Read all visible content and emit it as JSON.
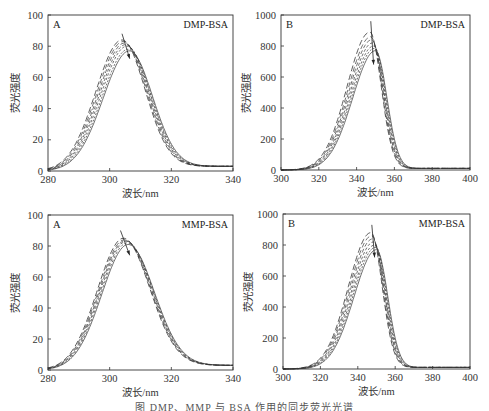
{
  "figure": {
    "caption": "图 DMP、MMP 与 BSA 作用的同步荧光光谱"
  },
  "chart_data": [
    {
      "id": "top-left",
      "type": "line",
      "panel_label": "A",
      "title": "DMP-BSA",
      "xlabel": "波长/nm",
      "ylabel": "荧光强度",
      "xlim": [
        280,
        340
      ],
      "ylim": [
        0,
        100
      ],
      "xticks": [
        280,
        300,
        320,
        340
      ],
      "yticks": [
        0,
        20,
        40,
        60,
        80,
        100
      ],
      "grid": false,
      "legend": "none",
      "annotation": "arrow indicating decreasing intensity with increasing concentration",
      "series": [
        {
          "name": "curve-1",
          "peak_x": 304.0,
          "peak_y": 84
        },
        {
          "name": "curve-2",
          "peak_x": 304.4,
          "peak_y": 83
        },
        {
          "name": "curve-3",
          "peak_x": 304.8,
          "peak_y": 82
        },
        {
          "name": "curve-4",
          "peak_x": 305.2,
          "peak_y": 81
        },
        {
          "name": "curve-5",
          "peak_x": 305.6,
          "peak_y": 80
        },
        {
          "name": "curve-6",
          "peak_x": 306.0,
          "peak_y": 78
        },
        {
          "name": "curve-7",
          "peak_x": 306.4,
          "peak_y": 77
        }
      ],
      "shape": {
        "sigma_left": 8.5,
        "sigma_right": 7.5,
        "baseline": 3
      },
      "arrow": {
        "x1": 304,
        "y1": 88,
        "x2": 306.5,
        "y2": 72
      }
    },
    {
      "id": "top-right",
      "type": "line",
      "panel_label": "B",
      "title": "DMP-BSA",
      "xlabel": "波长/nm",
      "ylabel": "荧光强度",
      "xlim": [
        300,
        400
      ],
      "ylim": [
        0,
        1000
      ],
      "xticks": [
        300,
        320,
        340,
        360,
        380,
        400
      ],
      "yticks": [
        0,
        200,
        400,
        600,
        800,
        1000
      ],
      "grid": false,
      "legend": "none",
      "annotation": "arrow indicating decreasing intensity with increasing concentration",
      "series": [
        {
          "name": "curve-1",
          "peak_x": 347.0,
          "peak_y": 890
        },
        {
          "name": "curve-2",
          "peak_x": 347.5,
          "peak_y": 860
        },
        {
          "name": "curve-3",
          "peak_x": 348.0,
          "peak_y": 840
        },
        {
          "name": "curve-4",
          "peak_x": 348.5,
          "peak_y": 820
        },
        {
          "name": "curve-5",
          "peak_x": 349.0,
          "peak_y": 800
        },
        {
          "name": "curve-6",
          "peak_x": 349.5,
          "peak_y": 785
        },
        {
          "name": "curve-7",
          "peak_x": 350.0,
          "peak_y": 770
        }
      ],
      "shape": {
        "sigma_left": 12,
        "sigma_right": 6,
        "baseline": 10
      },
      "arrow": {
        "x1": 347.5,
        "y1": 960,
        "x2": 349,
        "y2": 680
      }
    },
    {
      "id": "bottom-left",
      "type": "line",
      "panel_label": "A",
      "title": "MMP-BSA",
      "xlabel": "波长/nm",
      "ylabel": "荧光强度",
      "xlim": [
        280,
        340
      ],
      "ylim": [
        0,
        100
      ],
      "xticks": [
        280,
        300,
        320,
        340
      ],
      "yticks": [
        0,
        20,
        40,
        60,
        80,
        100
      ],
      "grid": false,
      "legend": "none",
      "annotation": "arrow indicating decreasing intensity with increasing concentration",
      "series": [
        {
          "name": "curve-1",
          "peak_x": 304.5,
          "peak_y": 85
        },
        {
          "name": "curve-2",
          "peak_x": 304.8,
          "peak_y": 84
        },
        {
          "name": "curve-3",
          "peak_x": 305.1,
          "peak_y": 83.5
        },
        {
          "name": "curve-4",
          "peak_x": 305.4,
          "peak_y": 83
        },
        {
          "name": "curve-5",
          "peak_x": 305.7,
          "peak_y": 82
        },
        {
          "name": "curve-6",
          "peak_x": 306.0,
          "peak_y": 81
        }
      ],
      "shape": {
        "sigma_left": 8.5,
        "sigma_right": 8.5,
        "baseline": 3
      },
      "arrow": {
        "x1": 303.5,
        "y1": 90,
        "x2": 306.5,
        "y2": 74
      }
    },
    {
      "id": "bottom-right",
      "type": "line",
      "panel_label": "B",
      "title": "MMP-BSA",
      "xlabel": "波长/nm",
      "ylabel": "荧光强度",
      "xlim": [
        300,
        400
      ],
      "ylim": [
        0,
        1000
      ],
      "xticks": [
        300,
        320,
        340,
        360,
        380,
        400
      ],
      "yticks": [
        0,
        200,
        400,
        600,
        800,
        1000
      ],
      "grid": false,
      "legend": "none",
      "annotation": "arrow indicating decreasing intensity with increasing concentration",
      "series": [
        {
          "name": "curve-1",
          "peak_x": 347.0,
          "peak_y": 880
        },
        {
          "name": "curve-2",
          "peak_x": 347.5,
          "peak_y": 860
        },
        {
          "name": "curve-3",
          "peak_x": 348.0,
          "peak_y": 840
        },
        {
          "name": "curve-4",
          "peak_x": 348.5,
          "peak_y": 820
        },
        {
          "name": "curve-5",
          "peak_x": 349.0,
          "peak_y": 800
        },
        {
          "name": "curve-6",
          "peak_x": 349.5,
          "peak_y": 785
        },
        {
          "name": "curve-7",
          "peak_x": 350.0,
          "peak_y": 770
        }
      ],
      "shape": {
        "sigma_left": 12,
        "sigma_right": 6,
        "baseline": 10
      },
      "arrow": {
        "x1": 347.5,
        "y1": 930,
        "x2": 349,
        "y2": 720
      }
    }
  ]
}
